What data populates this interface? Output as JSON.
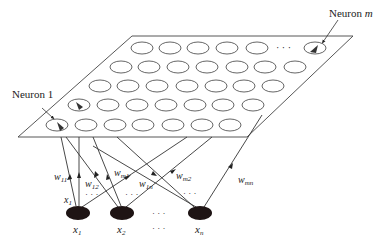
{
  "diagram": {
    "labels": {
      "neuron_first": "Neuron 1",
      "neuron_last_prefix": "Neuron ",
      "neuron_last_var": "m"
    },
    "grid": {
      "rows": 5,
      "ellipsis": "· · ·"
    },
    "inputs": [
      {
        "var": "x",
        "sub": "1"
      },
      {
        "var": "x",
        "sub": "2"
      },
      {
        "var": "x",
        "sub": "n"
      }
    ],
    "input_ellipsis": "· · ·",
    "edge_input_label": {
      "var": "x",
      "sub": "1"
    },
    "weights": [
      {
        "var": "w",
        "sub": "11"
      },
      {
        "var": "w",
        "sub": "12"
      },
      {
        "var": "w",
        "sub": "m1"
      },
      {
        "var": "w",
        "sub": "1n"
      },
      {
        "var": "w",
        "sub": "m2"
      },
      {
        "var": "w",
        "sub": "mn"
      }
    ],
    "weight_ellipsis": "· · ·",
    "colors": {
      "line": "#333333",
      "node_fill": "#1e1414"
    }
  }
}
